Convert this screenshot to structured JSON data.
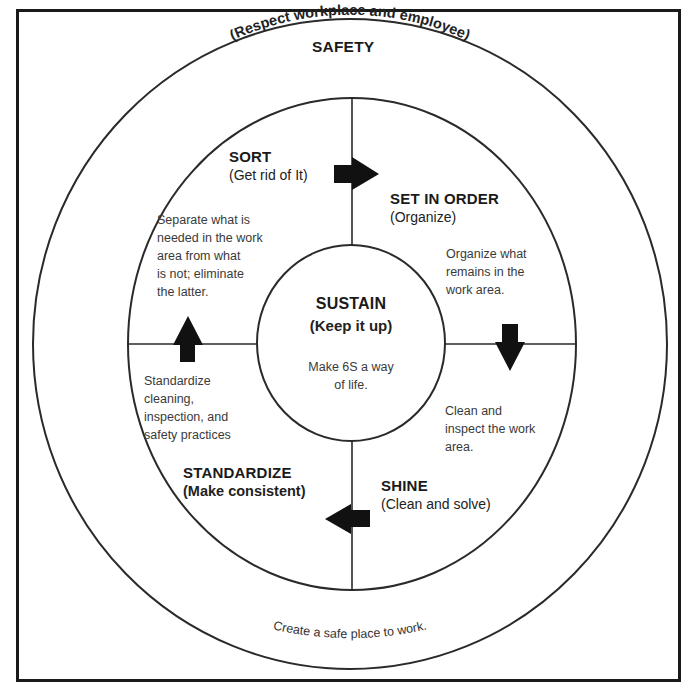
{
  "outer": {
    "title": "SAFETY",
    "subtitle": "(Respect workplace and employee)",
    "description": "Create a safe place to work."
  },
  "quadrants": {
    "sort": {
      "title": "SORT",
      "subtitle": "(Get rid of It)",
      "description": [
        "Separate what is",
        "needed in the work",
        "area from what",
        "is not; eliminate",
        "the latter."
      ]
    },
    "set_in_order": {
      "title": "SET IN ORDER",
      "subtitle": "(Organize)",
      "description": [
        "Organize what",
        "remains in the",
        "work area."
      ]
    },
    "shine": {
      "title": "SHINE",
      "subtitle": "(Clean and solve)",
      "description": [
        "Clean and",
        "inspect the work",
        "area."
      ]
    },
    "standardize": {
      "title": "STANDARDIZE",
      "subtitle": "(Make consistent)",
      "description": [
        "Standardize",
        "cleaning,",
        "inspection, and",
        "safety practices"
      ]
    }
  },
  "center": {
    "title": "SUSTAIN",
    "subtitle": "(Keep it up)",
    "description": [
      "Make 6S a way",
      "of life."
    ]
  },
  "arrows": [
    {
      "name": "sort-to-set-in-order",
      "direction": "right"
    },
    {
      "name": "set-in-order-to-shine",
      "direction": "down"
    },
    {
      "name": "shine-to-standardize",
      "direction": "left"
    },
    {
      "name": "standardize-to-sort",
      "direction": "up"
    }
  ],
  "colors": {
    "stroke": "#1a1a1a",
    "background": "#ffffff",
    "arrow": "#111111"
  }
}
